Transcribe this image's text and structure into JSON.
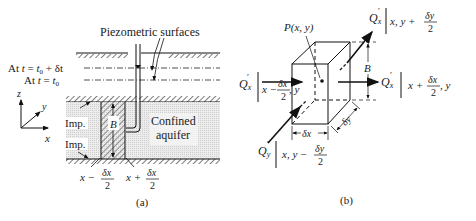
{
  "figure_a": {
    "caption": "(a)",
    "title_label": "Piezometric surfaces",
    "level_1": {
      "prefix": "At ",
      "var": "t",
      "eq": " = ",
      "value": "t",
      "sub": "0",
      "suffix": " + δt"
    },
    "level_2": {
      "prefix": "At ",
      "var": "t",
      "eq": " = ",
      "value": "t",
      "sub": "0"
    },
    "axes": {
      "z": "z",
      "y": "y",
      "x": "x"
    },
    "imp_top": "Imp.",
    "imp_bottom": "Imp.",
    "aquifer_line1": "Confined",
    "aquifer_line2": "aquifer",
    "thickness": "B",
    "left_bound": {
      "lead": "x −",
      "num": "δx",
      "den": "2"
    },
    "right_bound": {
      "lead": "x +",
      "num": "δx",
      "den": "2"
    }
  },
  "figure_b": {
    "caption": "(b)",
    "point_label": "P(x, y)",
    "thickness": "B",
    "dx_label": "δx",
    "dy_label": "δy",
    "flux_left": {
      "q": "Q",
      "sub": "x",
      "loc_lead": "x −",
      "num": "δx",
      "den": "2",
      "loc_tail": ", y"
    },
    "flux_right": {
      "q": "Q",
      "sub": "x",
      "loc_lead": "x +",
      "num": "δx",
      "den": "2",
      "loc_tail": ", y"
    },
    "flux_top": {
      "q": "Q",
      "sub": "x",
      "loc_lead": "x, y +",
      "num": "δy",
      "den": "2"
    },
    "flux_bottom": {
      "q": "Q",
      "sub": "y",
      "loc_lead": "x, y −",
      "num": "δy",
      "den": "2"
    }
  }
}
